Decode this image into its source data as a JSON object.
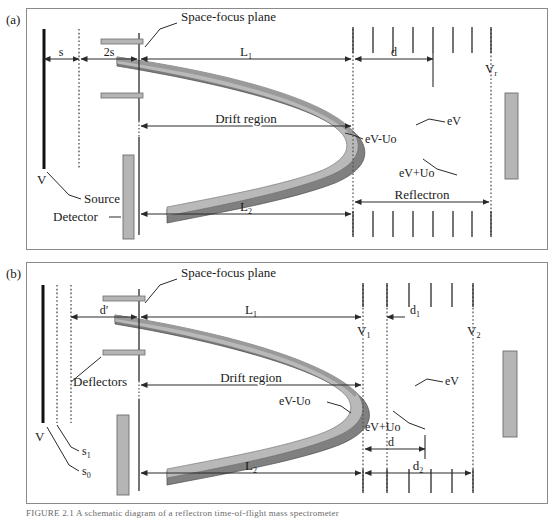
{
  "figure": {
    "type": "reflectron-tof-mass-spectrometer-schematic",
    "panels": [
      {
        "id": "a",
        "tag": "(a)",
        "labels": {
          "space_focus_plane": "Space-focus plane",
          "drift_region": "Drift region",
          "reflectron": "Reflectron",
          "source": "Source",
          "detector": "Detector",
          "V": "V",
          "Vr": "V",
          "Vr_sub": "r",
          "dim_s": "s",
          "dim_2s": "2s",
          "dim_L1": "L",
          "dim_L1_sub": "1",
          "dim_L2": "L",
          "dim_L2_sub": "2",
          "dim_d": "d",
          "band_outer": "eV+Uo",
          "band_inner": "eV-Uo",
          "band_mid": "eV"
        }
      },
      {
        "id": "b",
        "tag": "(b)",
        "labels": {
          "space_focus_plane": "Space-focus plane",
          "drift_region": "Drift region",
          "deflectors": "Deflectors",
          "V": "V",
          "s1": "s",
          "s1_sub": "1",
          "s0": "s",
          "s0_sub": "0",
          "V1": "V",
          "V1_sub": "1",
          "V2": "V",
          "V2_sub": "2",
          "dim_dprime": "d′",
          "dim_L1": "L",
          "dim_L1_sub": "1",
          "dim_L2": "L",
          "dim_L2_sub": "2",
          "dim_d1": "d",
          "dim_d1_sub": "1",
          "dim_d2": "d",
          "dim_d2_sub": "2",
          "dim_d": "d",
          "band_outer": "eV+Uo",
          "band_inner": "eV-Uo",
          "band_mid": "eV"
        }
      }
    ],
    "colors": {
      "band_dark": "#808080",
      "band_light": "#b9b9b9",
      "band_mid": "#9a9a9a",
      "plate_fill": "#b5b5b5",
      "plate_stroke": "#6e6e6e",
      "line": "#2a2a2a",
      "frame": "#8a8a8a",
      "dotted": "#555555"
    },
    "caption": "FIGURE 2.1  A schematic diagram of a reflectron time-of-flight mass spectrometer"
  }
}
